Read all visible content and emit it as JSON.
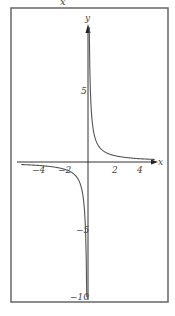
{
  "caption_top": "x",
  "chart_data": {
    "type": "line",
    "title": "",
    "function": "y = 1/x",
    "xlabel": "x",
    "ylabel": "y",
    "xlim": [
      -5.5,
      5.5
    ],
    "ylim": [
      -10,
      10
    ],
    "x_ticks": [
      -4,
      -2,
      2,
      4
    ],
    "x_tick_labels": [
      "−4",
      "−2",
      "2",
      "4"
    ],
    "y_ticks": [
      5,
      -5,
      -10
    ],
    "y_tick_labels": [
      "5",
      "−5",
      "−10"
    ],
    "grid": false,
    "legend": null,
    "series": [
      {
        "name": "y = 1/x (x > 0)",
        "x": [
          0.1,
          0.15,
          0.2,
          0.3,
          0.5,
          1,
          2,
          3,
          4,
          5
        ],
        "y": [
          10,
          6.67,
          5,
          3.33,
          2,
          1,
          0.5,
          0.33,
          0.25,
          0.2
        ]
      },
      {
        "name": "y = 1/x (x < 0)",
        "x": [
          -5,
          -4,
          -3,
          -2,
          -1,
          -0.5,
          -0.3,
          -0.2,
          -0.15,
          -0.1
        ],
        "y": [
          -0.2,
          -0.25,
          -0.33,
          -0.5,
          -1,
          -2,
          -3.33,
          -5,
          -6.67,
          -10
        ]
      }
    ],
    "colors": {
      "axis": "#333333",
      "curve": "#555555",
      "frame": "#666666"
    }
  }
}
